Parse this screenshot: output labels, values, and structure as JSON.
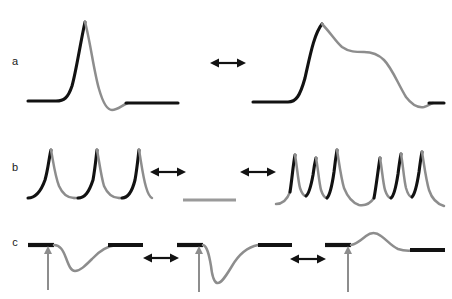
{
  "figure": {
    "background_color": "#ffffff",
    "black_color": "#121212",
    "gray_color": "#8d8d8d",
    "width": 452,
    "height": 299
  },
  "rows": [
    {
      "label": "a",
      "label_x": 15,
      "label_y": 62,
      "description": "narrow spike transitions to broad plateau waveform"
    },
    {
      "label": "b",
      "label_x": 15,
      "label_y": 168,
      "description": "regular spike train to silent flat line to bursting pattern"
    },
    {
      "label": "c",
      "label_x": 15,
      "label_y": 243,
      "description": "shallow downward response to deep downward response to inverted upward response"
    }
  ],
  "arrows": [
    {
      "name": "arrow-a-1",
      "x1": 210,
      "x2": 246,
      "y": 63
    },
    {
      "name": "arrow-b-1",
      "x1": 150,
      "x2": 186,
      "y": 172
    },
    {
      "name": "arrow-b-2",
      "x1": 240,
      "x2": 276,
      "y": 172
    },
    {
      "name": "arrow-c-1",
      "x1": 143,
      "x2": 179,
      "y": 258
    },
    {
      "name": "arrow-c-2",
      "x1": 290,
      "x2": 326,
      "y": 259
    }
  ],
  "stimulus_arrows": [
    {
      "name": "stimulus-arrow-c-1",
      "x": 48,
      "y_top": 246,
      "y_bottom": 290
    },
    {
      "name": "stimulus-arrow-c-2",
      "x": 199,
      "y_top": 246,
      "y_bottom": 292
    },
    {
      "name": "stimulus-arrow-c-3",
      "x": 348,
      "y_top": 246,
      "y_bottom": 292
    }
  ],
  "traces": {
    "a_left_black_base_in": "M 28,101 L 56,101 C 64,101 68,98 72,86 C 76,72 80,45 85,22",
    "a_left_gray_fall": "M 85,22 C 90,40 94,72 99,89 C 103,103 107,110 112,110 C 118,110 122,105 128,103",
    "a_left_black_base_out": "M 126,103 L 178,103",
    "a_right_black_base_in": "M 253,102 L 288,102 C 296,102 300,96 305,78 C 310,56 314,34 322,24",
    "a_right_gray_fall": "M 322,24 C 330,32 336,42 342,47 C 349,52 356,52 364,52 C 372,52 378,54 384,60 C 392,68 398,84 406,97 C 412,105 418,108 424,107 C 428,106 430,104 433,103",
    "a_right_black_base_out": "M 429,103 L 444,103",
    "b_left_spike_1_black": "M 28,198 C 34,198 40,194 45,180 C 48,170 49,158 51,150",
    "b_left_spike_1_gray": "M 51,150 C 53,160 55,176 59,186 C 63,195 68,198 74,198",
    "b_left_trough_1_gray": "M 74,198 L 80,198",
    "b_left_spike_2_black": "M 78,198 C 85,198 89,192 93,180 C 95,169 96,158 97,150",
    "b_left_spike_2_gray": "M 97,150 C 99,160 101,176 104,186 C 108,195 113,198 119,198",
    "b_left_trough_2_gray": "M 119,198 L 124,198",
    "b_left_spike_3_black": "M 122,198 C 128,198 132,192 135,180 C 137,169 138,158 139,150",
    "b_left_spike_3_gray": "M 139,150 C 141,161 143,177 146,187 C 148,194 150,197 152,198",
    "b_mid_gray_flat": "M 183,200 L 236,200",
    "b_right_gray_onset": "M 276,204 C 282,204 287,200 290,192",
    "b_right_spike_1_black": "M 290,192 C 292,180 293,165 295,155",
    "b_right_spike_1_gray": "M 295,155 C 297,166 298,180 300,188 C 302,194 304,196 306,196",
    "b_right_spike_2_black": "M 306,196 C 309,194 311,186 313,175 C 314,167 315,162 316,158",
    "b_right_spike_2_gray": "M 316,158 C 318,168 319,182 321,190 C 323,196 325,198 327,198",
    "b_right_spike_3_black": "M 327,198 C 330,195 332,186 334,172 C 335,163 336,156 337,150",
    "b_right_spike_3_gray": "M 337,150 C 339,162 341,178 344,188 C 348,198 353,203 359,205 C 365,206 370,204 374,198",
    "b_right_spike_4_black": "M 374,198 C 376,188 378,170 380,158",
    "b_right_spike_4_gray": "M 380,158 C 382,169 383,183 385,190 C 387,196 389,198 391,198",
    "b_right_spike_5_black": "M 391,198 C 394,196 396,187 398,174 C 399,166 400,159 401,154",
    "b_right_spike_5_gray": "M 401,154 C 403,165 404,180 406,188 C 408,195 410,197 412,197",
    "b_right_spike_6_black": "M 412,197 C 415,194 417,185 419,172 C 420,164 421,157 422,152",
    "b_right_spike_6_gray": "M 422,152 C 424,164 426,180 429,190 C 432,199 437,204 444,206",
    "c_left_base_black": "M 28,245 L 54,245",
    "c_left_gray_response": "M 54,245 C 60,245 63,250 66,258 C 69,266 71,271 75,271 C 80,271 85,266 92,259 C 100,250 108,246 116,245",
    "c_left_base_out_black": "M 108,245 L 143,245",
    "c_mid_base_black": "M 177,245 L 203,245",
    "c_mid_gray_response": "M 203,245 C 207,246 209,254 211,266 C 212,275 214,282 217,283 C 221,284 226,276 232,266 C 239,254 248,247 258,245",
    "c_mid_base_out_black": "M 258,245 L 292,245",
    "c_right_base_black": "M 325,245 L 351,245",
    "c_right_gray_response": "M 351,245 C 357,244 361,240 366,236 C 371,232 376,232 381,236 C 387,240 391,246 398,249 C 404,251 410,251 416,250",
    "c_right_base_out_black": "M 410,250 L 445,250"
  }
}
